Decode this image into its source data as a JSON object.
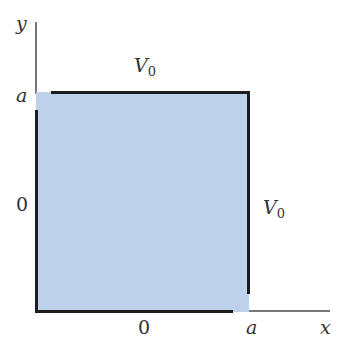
{
  "diagram": {
    "axes": {
      "x_label": "x",
      "y_label": "y"
    },
    "ticks": {
      "x_origin": "0",
      "x_end": "a",
      "y_end": "a"
    },
    "boundaries": {
      "top": {
        "label_main": "V",
        "label_sub": "0"
      },
      "right": {
        "label_main": "V",
        "label_sub": "0"
      },
      "left": {
        "label": "0"
      },
      "bottom": {
        "label": "0"
      }
    },
    "colors": {
      "region_fill": "#bdd1ea",
      "boundary": "#1c1c1c",
      "axis": "#777777"
    }
  }
}
